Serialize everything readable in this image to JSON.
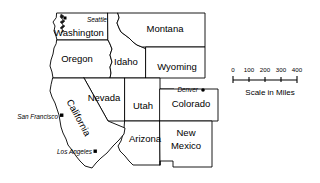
{
  "map": {
    "title": "Western United States reference map",
    "background_color": "#ffffff",
    "line_color": "#000000",
    "states": [
      {
        "id": "washington",
        "label": "Washington",
        "label_x": 79,
        "label_y": 33
      },
      {
        "id": "oregon",
        "label": "Oregon",
        "label_x": 77,
        "label_y": 59
      },
      {
        "id": "idaho",
        "label": "Idaho",
        "label_x": 126,
        "label_y": 62
      },
      {
        "id": "montana",
        "label": "Montana",
        "label_x": 165,
        "label_y": 29
      },
      {
        "id": "wyoming",
        "label": "Wyoming",
        "label_x": 177,
        "label_y": 67
      },
      {
        "id": "nevada",
        "label": "Nevada",
        "label_x": 104,
        "label_y": 98
      },
      {
        "id": "utah",
        "label": "Utah",
        "label_x": 143,
        "label_y": 106
      },
      {
        "id": "colorado",
        "label": "Colorado",
        "label_x": 191,
        "label_y": 104
      },
      {
        "id": "arizona",
        "label": "Arizona",
        "label_x": 145,
        "label_y": 139
      },
      {
        "id": "new-mexico",
        "label_line1": "New",
        "label_line2": "Mexico",
        "label_x": 186,
        "label_y": 139
      },
      {
        "id": "california",
        "label": "California",
        "label_x": 78,
        "label_y": 118,
        "rotation": 62
      }
    ],
    "cities": [
      {
        "id": "seattle",
        "label": "Seattle",
        "label_x": 87,
        "label_y": 20,
        "dot_x": 65,
        "dot_y": 18,
        "anchor": "start"
      },
      {
        "id": "denver",
        "label": "Denver",
        "label_x": 196,
        "label_y": 90,
        "dot_x": 203,
        "dot_y": 90,
        "anchor": "end"
      },
      {
        "id": "san-francisco",
        "label": "San Francisco",
        "label_x": 58,
        "label_y": 117,
        "dot_x": 61,
        "dot_y": 115,
        "anchor": "end"
      },
      {
        "id": "los-angeles",
        "label": "Los Angeles",
        "label_x": 91,
        "label_y": 152,
        "dot_x": 95,
        "dot_y": 151,
        "anchor": "end"
      }
    ],
    "scale_bar": {
      "caption": "Scale in Miles",
      "caption_x": 270,
      "caption_y": 92,
      "ticks": [
        {
          "label": "0",
          "x": 233
        },
        {
          "label": "100",
          "x": 249
        },
        {
          "label": "200",
          "x": 265
        },
        {
          "label": "300",
          "x": 281
        },
        {
          "label": "400",
          "x": 297
        }
      ],
      "label_y": 72,
      "bar_y": 79,
      "tick_top": 76,
      "tick_bottom": 82
    }
  }
}
